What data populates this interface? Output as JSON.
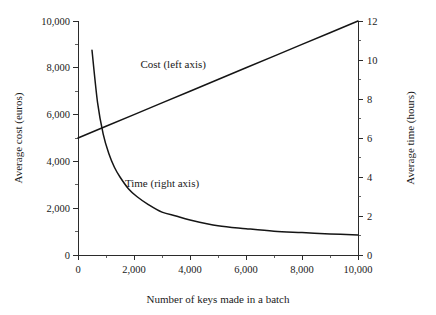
{
  "chart_data": {
    "type": "line",
    "title": "",
    "xlabel": "Number of keys made in a batch",
    "ylabel": "Average cost (euros)",
    "y2label": "Average time (hours)",
    "xlim": [
      0,
      10000
    ],
    "ylim": [
      0,
      10000
    ],
    "y2lim": [
      0,
      12
    ],
    "grid": false,
    "legend_position": "inline-annotations",
    "xticks": [
      0,
      2000,
      4000,
      6000,
      8000,
      10000
    ],
    "xticklabels": [
      "0",
      "2,000",
      "4,000",
      "6,000",
      "8,000",
      "10,000"
    ],
    "x_minor_ticks": [
      1000,
      3000,
      5000,
      7000,
      9000
    ],
    "yticks": [
      0,
      2000,
      4000,
      6000,
      8000,
      10000
    ],
    "yticklabels": [
      "0",
      "2,000",
      "4,000",
      "6,000",
      "8,000",
      "10,000"
    ],
    "y_minor_ticks": [
      1000,
      3000,
      5000,
      7000,
      9000
    ],
    "y2ticks": [
      0,
      2,
      4,
      6,
      8,
      10,
      12
    ],
    "y2ticklabels": [
      "0",
      "2",
      "4",
      "6",
      "8",
      "10",
      "12"
    ],
    "y2_minor_ticks": [
      1,
      3,
      5,
      7,
      9,
      11
    ],
    "annotations": [
      {
        "text": "Cost (left axis)",
        "x": 3400,
        "y": 8000
      },
      {
        "text": "Time (right axis)",
        "x": 3000,
        "y": 2900
      }
    ],
    "series": [
      {
        "name": "Cost (left axis)",
        "axis": "left",
        "units": "euros",
        "x": [
          0,
          1000,
          2000,
          3000,
          4000,
          5000,
          6000,
          7000,
          8000,
          9000,
          10000
        ],
        "values": [
          5000,
          5500,
          6000,
          6500,
          7000,
          7500,
          8000,
          8500,
          9000,
          9500,
          10000
        ]
      },
      {
        "name": "Time (right axis)",
        "axis": "right",
        "units": "hours",
        "x": [
          500,
          700,
          900,
          1100,
          1300,
          1500,
          1800,
          2100,
          2500,
          3000,
          3500,
          4000,
          5000,
          6000,
          7000,
          8000,
          9000,
          10000
        ],
        "values": [
          10.5,
          7.8,
          6.2,
          5.2,
          4.5,
          4.0,
          3.4,
          3.0,
          2.6,
          2.2,
          2.0,
          1.8,
          1.5,
          1.35,
          1.22,
          1.15,
          1.08,
          1.03
        ]
      }
    ]
  }
}
